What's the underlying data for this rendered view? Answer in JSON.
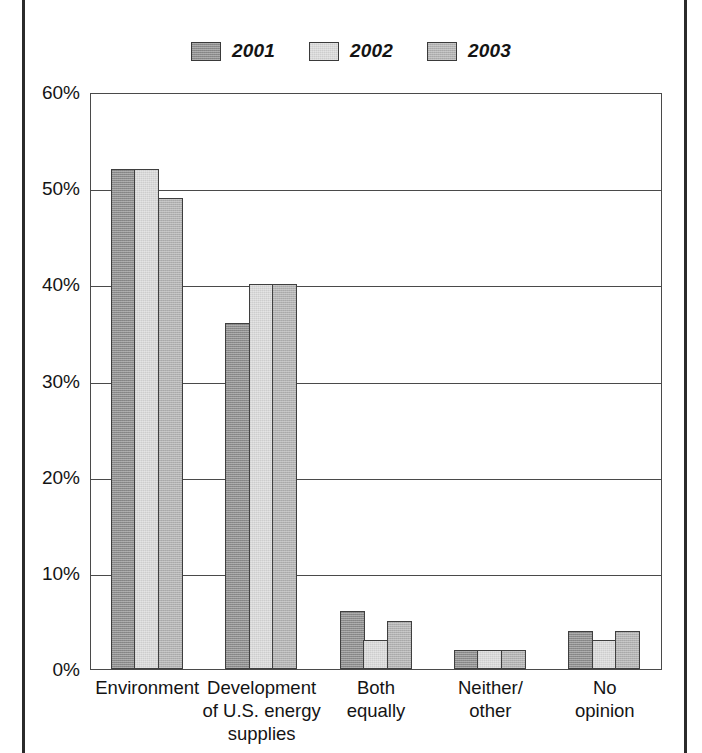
{
  "chart_data": {
    "type": "bar",
    "title": "",
    "subtitle": "",
    "xlabel": "",
    "ylabel": "",
    "ylim": [
      0,
      60
    ],
    "ytick_labels": [
      "0%",
      "10%",
      "20%",
      "30%",
      "40%",
      "50%",
      "60%"
    ],
    "ytick_values": [
      0,
      10,
      20,
      30,
      40,
      50,
      60
    ],
    "grid": true,
    "legend_position": "top-center",
    "categories": [
      "Environment",
      "Development\nof U.S. energy\nsupplies",
      "Both\nequally",
      "Neither/\nother",
      "No opinion"
    ],
    "category_lines": [
      [
        "Environment"
      ],
      [
        "Development",
        "of U.S. energy",
        "supplies"
      ],
      [
        "Both",
        "equally"
      ],
      [
        "Neither/",
        "other"
      ],
      [
        "No opinion"
      ]
    ],
    "series": [
      {
        "name": "2001",
        "color": "#8c8c8c",
        "values": [
          52,
          36,
          6,
          2,
          4
        ]
      },
      {
        "name": "2002",
        "color": "#d8d8d8",
        "values": [
          52,
          40,
          3,
          2,
          3
        ]
      },
      {
        "name": "2003",
        "color": "#b2b2b2",
        "values": [
          49,
          40,
          5,
          2,
          4
        ]
      }
    ]
  },
  "legend": {
    "items": [
      {
        "label": "2001",
        "color": "#8c8c8c"
      },
      {
        "label": "2002",
        "color": "#d8d8d8"
      },
      {
        "label": "2003",
        "color": "#b2b2b2"
      }
    ]
  },
  "colors": {
    "axis": "#4a4a4a",
    "bar_outline": "#3f3f3f",
    "text": "#141414",
    "page_rule": "#2b2b2b",
    "background": "#ffffff"
  }
}
